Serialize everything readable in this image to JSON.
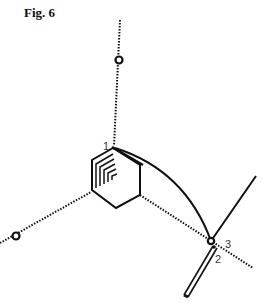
{
  "figure": {
    "title": "Fig. 6",
    "labels": {
      "point1": "1",
      "point2": "2",
      "point3": "3"
    },
    "colors": {
      "ink": "#111111",
      "label": "#333333",
      "background": "#ffffff"
    },
    "elements": {
      "ring": "hexagon",
      "dotted_axes": 3,
      "open_circle_markers": 3,
      "curved_arc": "from point 1 to point 3",
      "rod": "double-line segment through points 2 and 3"
    }
  }
}
